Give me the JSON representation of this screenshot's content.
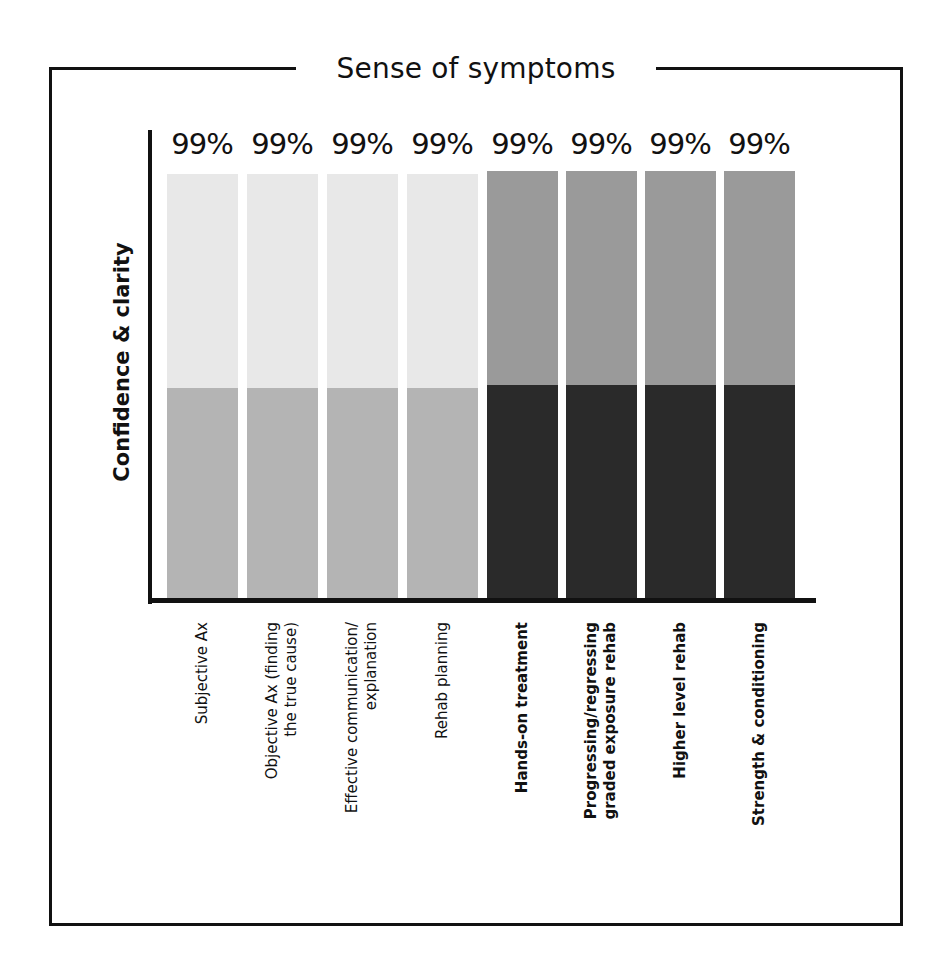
{
  "title": "Sense of symptoms",
  "y_axis_label": "Confidence & clarity",
  "colors": {
    "light_top": "#e8e8e8",
    "light_bottom": "#b4b4b4",
    "dark_top": "#9a9a9a",
    "dark_bottom": "#2a2a2a",
    "axis": "#111111"
  },
  "bars": [
    {
      "label": "Subjective Ax",
      "value_label": "99%",
      "group": "light"
    },
    {
      "label": "Objective Ax (finding\nthe true cause)",
      "value_label": "99%",
      "group": "light"
    },
    {
      "label": "Effective communication/\nexplanation",
      "value_label": "99%",
      "group": "light"
    },
    {
      "label": "Rehab planning",
      "value_label": "99%",
      "group": "light"
    },
    {
      "label": "Hands-on treatment",
      "value_label": "99%",
      "group": "dark"
    },
    {
      "label": "Progressing/regressing\ngraded exposure rehab",
      "value_label": "99%",
      "group": "dark"
    },
    {
      "label": "Higher level rehab",
      "value_label": "99%",
      "group": "dark"
    },
    {
      "label": "Strength & conditioning",
      "value_label": "99%",
      "group": "dark"
    }
  ],
  "chart_data": {
    "type": "bar",
    "stacked": true,
    "title": "Sense of symptoms",
    "xlabel": "",
    "ylabel": "Confidence & clarity",
    "categories": [
      "Subjective Ax",
      "Objective Ax (finding the true cause)",
      "Effective communication/ explanation",
      "Rehab planning",
      "Hands-on treatment",
      "Progressing/regressing graded exposure rehab",
      "Higher level rehab",
      "Strength & conditioning"
    ],
    "values": [
      99,
      99,
      99,
      99,
      99,
      99,
      99,
      99
    ],
    "value_labels": [
      "99%",
      "99%",
      "99%",
      "99%",
      "99%",
      "99%",
      "99%",
      "99%"
    ],
    "series": [
      {
        "name": "bottom segment",
        "values": [
          49.5,
          49.5,
          49.5,
          49.5,
          49.5,
          49.5,
          49.5,
          49.5
        ]
      },
      {
        "name": "top segment",
        "values": [
          49.5,
          49.5,
          49.5,
          49.5,
          49.5,
          49.5,
          49.5,
          49.5
        ]
      }
    ],
    "ylim": [
      0,
      100
    ],
    "grid": false,
    "legend": "none",
    "y_ticks": "none",
    "x_label_style": "rotated -90; first four regular weight, last four bold",
    "bar_color_groups": [
      "light gray (first 4)",
      "dark gray (last 4)"
    ]
  }
}
